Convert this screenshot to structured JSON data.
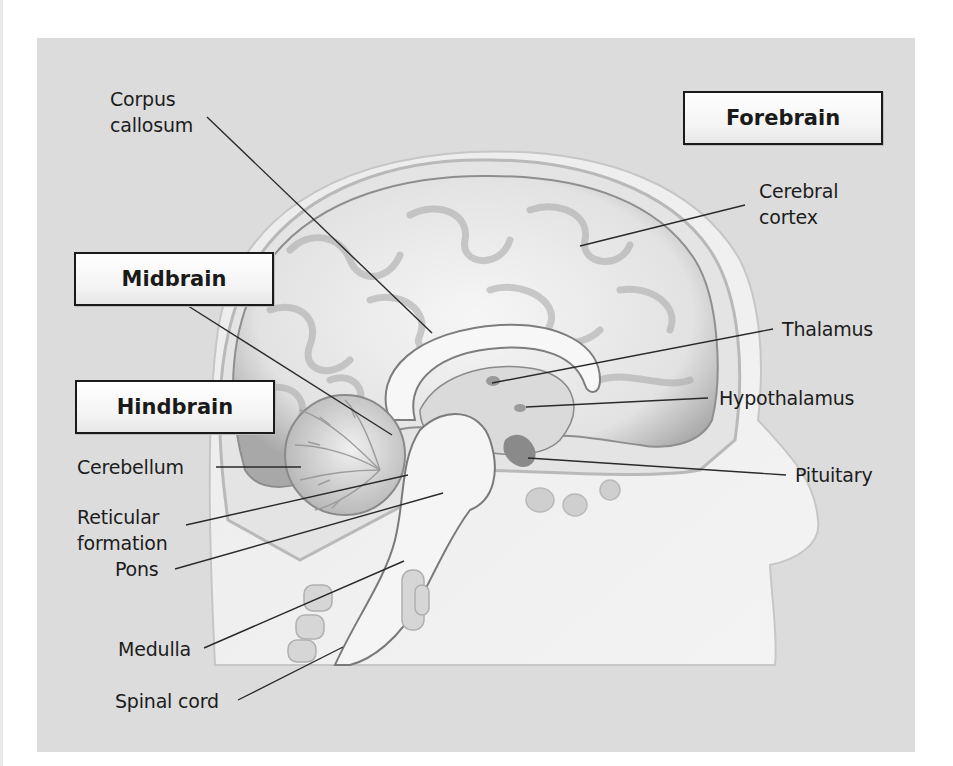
{
  "diagram": {
    "regions": [
      {
        "key": "forebrain",
        "label": "Forebrain"
      },
      {
        "key": "midbrain",
        "label": "Midbrain"
      },
      {
        "key": "hindbrain",
        "label": "Hindbrain"
      }
    ],
    "labels": {
      "corpus_callosum": [
        "Corpus",
        "callosum"
      ],
      "cerebral_cortex": [
        "Cerebral",
        "cortex"
      ],
      "thalamus": "Thalamus",
      "hypothalamus": "Hypothalamus",
      "pituitary": "Pituitary",
      "cerebellum": "Cerebellum",
      "reticular_formation": [
        "Reticular",
        "formation"
      ],
      "pons": "Pons",
      "medulla": "Medulla",
      "spinal_cord": "Spinal cord"
    },
    "colors": {
      "panel_background": "#dcdcdc",
      "tissue_light": "#f4f4f4",
      "tissue_shadow": "#9a9a9a",
      "leader_line": "#2a2a2a",
      "box_border": "#1a1a1a"
    }
  }
}
